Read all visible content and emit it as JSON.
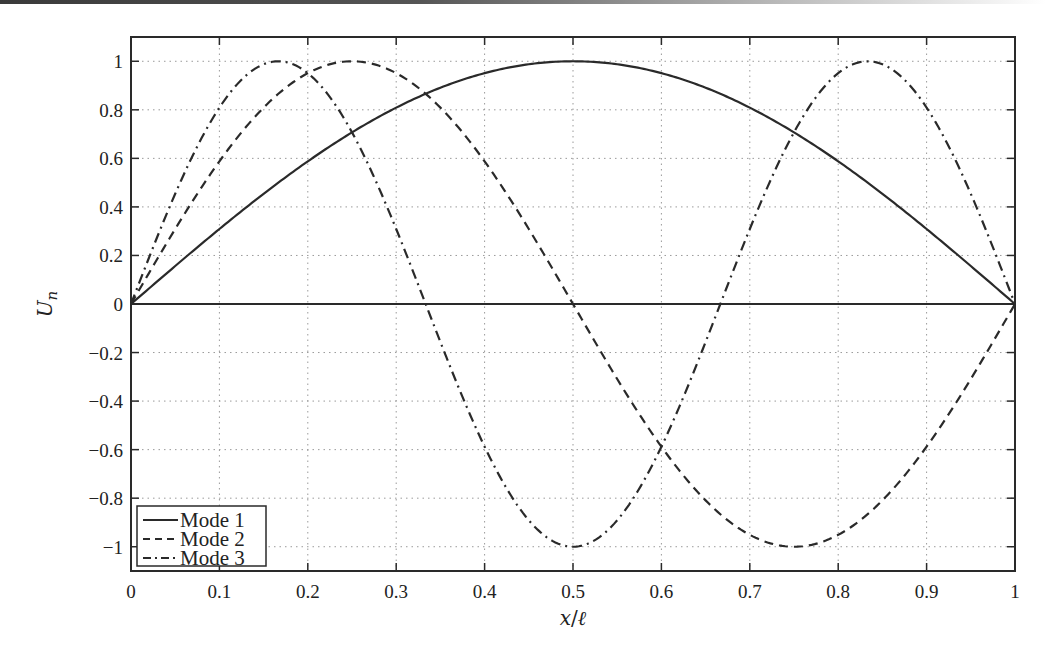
{
  "chart_data": {
    "type": "line",
    "title": "",
    "xlabel": "x/ℓ",
    "ylabel": "U_n",
    "xlim": [
      0,
      1
    ],
    "ylim": [
      -1.1,
      1.1
    ],
    "grid": true,
    "grid_style": "dotted",
    "legend_position": "lower left",
    "x_ticks": [
      "0",
      "0.1",
      "0.2",
      "0.3",
      "0.4",
      "0.5",
      "0.6",
      "0.7",
      "0.8",
      "0.9",
      "1"
    ],
    "y_ticks": [
      "1",
      "0.8",
      "0.6",
      "0.4",
      "0.2",
      "0",
      "-0.2",
      "-0.4",
      "-0.6",
      "-0.8",
      "-1"
    ],
    "x": [
      0,
      0.05,
      0.1,
      0.15,
      0.2,
      0.25,
      0.3,
      0.35,
      0.4,
      0.45,
      0.5,
      0.55,
      0.6,
      0.65,
      0.7,
      0.75,
      0.8,
      0.85,
      0.9,
      0.95,
      1
    ],
    "series": [
      {
        "name": "Mode 1",
        "style": "solid",
        "formula": "sin(pi x)",
        "values": [
          0,
          0.156,
          0.309,
          0.454,
          0.588,
          0.707,
          0.809,
          0.891,
          0.951,
          0.988,
          1,
          0.988,
          0.951,
          0.891,
          0.809,
          0.707,
          0.588,
          0.454,
          0.309,
          0.156,
          0
        ]
      },
      {
        "name": "Mode 2",
        "style": "dashed",
        "formula": "sin(2 pi x)",
        "values": [
          0,
          0.309,
          0.588,
          0.809,
          0.951,
          1,
          0.951,
          0.809,
          0.588,
          0.309,
          0,
          -0.309,
          -0.588,
          -0.809,
          -0.951,
          -1,
          -0.951,
          -0.809,
          -0.588,
          -0.309,
          0
        ]
      },
      {
        "name": "Mode 3",
        "style": "dash-dot",
        "formula": "sin(3 pi x)",
        "values": [
          0,
          0.454,
          0.809,
          0.988,
          0.951,
          0.707,
          0.309,
          -0.156,
          -0.588,
          -0.891,
          -1,
          -0.891,
          -0.588,
          -0.156,
          0.309,
          0.707,
          0.951,
          0.988,
          0.809,
          0.454,
          0
        ]
      }
    ],
    "reference_line": {
      "y": 0,
      "style": "solid"
    }
  },
  "legend": {
    "items": [
      {
        "label": "Mode 1",
        "style": "solid"
      },
      {
        "label": "Mode 2",
        "style": "dashed"
      },
      {
        "label": "Mode 3",
        "style": "dash-dot"
      }
    ]
  },
  "axes": {
    "xlabel_main": "x",
    "xlabel_sep": "/",
    "xlabel_ell": "ℓ",
    "ylabel_main": "U",
    "ylabel_sub": "n"
  },
  "colors": {
    "line": "#2a2a2a",
    "grid": "#9a9a9a",
    "axis": "#2a2a2a"
  }
}
